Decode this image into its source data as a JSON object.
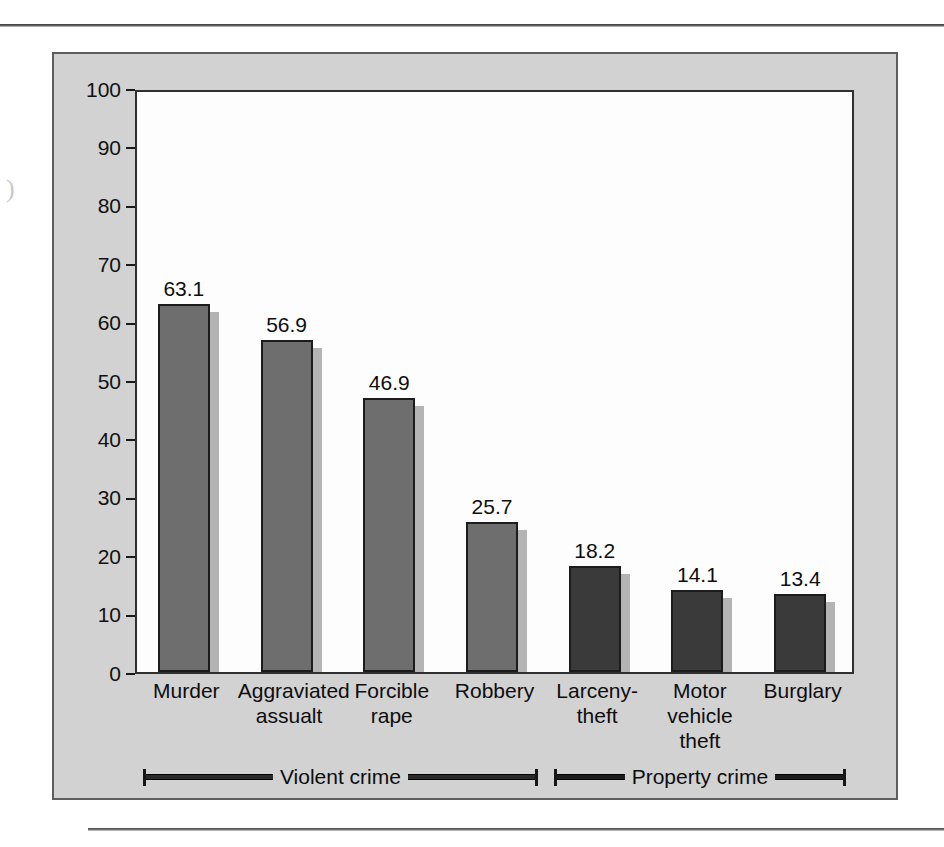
{
  "figure": {
    "background_color": "#d2d2d2",
    "plot_background_color": "#fdfdfd"
  },
  "margin_mark": ")",
  "chart_data": {
    "type": "bar",
    "title": "",
    "subtitle": "",
    "xlabel": "",
    "ylabel": "",
    "ylim": [
      0,
      100
    ],
    "grid": false,
    "legend_position": "bottom",
    "categories": [
      "Murder",
      "Aggraviated assualt",
      "Forcible rape",
      "Robbery",
      "Larceny-theft",
      "Motor vehicle theft",
      "Burglary"
    ],
    "category_lines": [
      [
        "Murder"
      ],
      [
        "Aggraviated",
        "assualt"
      ],
      [
        "Forcible",
        "rape"
      ],
      [
        "Robbery"
      ],
      [
        "Larceny-",
        "theft"
      ],
      [
        "Motor",
        "vehicle",
        "theft"
      ],
      [
        "Burglary"
      ]
    ],
    "values": [
      63.1,
      56.9,
      46.9,
      25.7,
      18.2,
      14.1,
      13.4
    ],
    "value_labels": [
      "63.1",
      "56.9",
      "46.9",
      "25.7",
      "18.2",
      "14.1",
      "13.4"
    ],
    "groups": [
      "Violent crime",
      "Violent crime",
      "Violent crime",
      "Violent crime",
      "Property crime",
      "Property crime",
      "Property crime"
    ],
    "bar_colors": [
      "#6e6e6e",
      "#6e6e6e",
      "#6e6e6e",
      "#6e6e6e",
      "#3a3a3a",
      "#3a3a3a",
      "#3a3a3a"
    ],
    "shadow_color": "#b4b4b4",
    "yticks": [
      0,
      10,
      20,
      30,
      40,
      50,
      60,
      70,
      80,
      90,
      100
    ],
    "ytick_labels": [
      "0",
      "10",
      "20",
      "30",
      "40",
      "50",
      "60",
      "70",
      "80",
      "90",
      "100"
    ],
    "legend": [
      {
        "label": "Violent crime",
        "color": "#6e6e6e",
        "span_categories": 4
      },
      {
        "label": "Property crime",
        "color": "#3a3a3a",
        "span_categories": 3
      }
    ]
  }
}
